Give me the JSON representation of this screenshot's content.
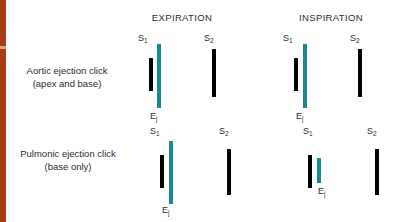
{
  "figure": {
    "background_color": "#ffffff",
    "accent_edge_color": "#a63c18",
    "black_color": "#000000",
    "teal_color": "#17888c"
  },
  "columns": [
    {
      "id": "expiration",
      "label": "EXPIRATION"
    },
    {
      "id": "inspiration",
      "label": "INSPIRATION"
    }
  ],
  "rows": [
    {
      "id": "aortic-ejection-click",
      "label_line1": "Aortic ejection click",
      "label_line2": "(apex and base)"
    },
    {
      "id": "pulmonic-ejection-click",
      "label_line1": "Pulmonic ejection click",
      "label_line2": "(base only)"
    }
  ],
  "sound_labels": {
    "s1": "S",
    "s1_sub": "1",
    "s2": "S",
    "s2_sub": "2",
    "ej": "E",
    "ej_sub": "j"
  },
  "chart_data": {
    "type": "bar",
    "xlabel": "",
    "ylabel": "",
    "grid": false,
    "legend": "none",
    "marks": [
      {
        "row": "aortic-ejection-click",
        "column": "expiration",
        "name": "S1",
        "color": "#000000",
        "x": 149,
        "y": 58,
        "width": 4,
        "height": 33,
        "label": "S1",
        "label_x": 138,
        "label_y": 33
      },
      {
        "row": "aortic-ejection-click",
        "column": "expiration",
        "name": "Ej",
        "color": "#17888c",
        "x": 157,
        "y": 44,
        "width": 4,
        "height": 64,
        "label": "Ej",
        "label_x": 150,
        "label_y": 111
      },
      {
        "row": "aortic-ejection-click",
        "column": "expiration",
        "name": "S2",
        "color": "#000000",
        "x": 212,
        "y": 49,
        "width": 4,
        "height": 48,
        "label": "S2",
        "label_x": 204,
        "label_y": 33
      },
      {
        "row": "aortic-ejection-click",
        "column": "inspiration",
        "name": "S1",
        "color": "#000000",
        "x": 294,
        "y": 58,
        "width": 4,
        "height": 33,
        "label": "S1",
        "label_x": 283,
        "label_y": 33
      },
      {
        "row": "aortic-ejection-click",
        "column": "inspiration",
        "name": "Ej",
        "color": "#17888c",
        "x": 303,
        "y": 44,
        "width": 4,
        "height": 64,
        "label": "Ej",
        "label_x": 296,
        "label_y": 111
      },
      {
        "row": "aortic-ejection-click",
        "column": "inspiration",
        "name": "S2",
        "color": "#000000",
        "x": 358,
        "y": 49,
        "width": 4,
        "height": 48,
        "label": "S2",
        "label_x": 350,
        "label_y": 33
      },
      {
        "row": "pulmonic-ejection-click",
        "column": "expiration",
        "name": "S1",
        "color": "#000000",
        "x": 160,
        "y": 155,
        "width": 4,
        "height": 33,
        "label": "S1",
        "label_x": 150,
        "label_y": 126
      },
      {
        "row": "pulmonic-ejection-click",
        "column": "expiration",
        "name": "Ej",
        "color": "#17888c",
        "x": 169,
        "y": 141,
        "width": 4,
        "height": 63,
        "label": "Ej",
        "label_x": 162,
        "label_y": 205
      },
      {
        "row": "pulmonic-ejection-click",
        "column": "expiration",
        "name": "S2",
        "color": "#000000",
        "x": 227,
        "y": 149,
        "width": 4,
        "height": 46,
        "label": "S2",
        "label_x": 219,
        "label_y": 126
      },
      {
        "row": "pulmonic-ejection-click",
        "column": "inspiration",
        "name": "S1",
        "color": "#000000",
        "x": 308,
        "y": 155,
        "width": 4,
        "height": 33,
        "label": "S1",
        "label_x": 303,
        "label_y": 126
      },
      {
        "row": "pulmonic-ejection-click",
        "column": "inspiration",
        "name": "Ej",
        "color": "#17888c",
        "x": 317,
        "y": 158,
        "width": 4,
        "height": 25,
        "label": "Ej",
        "label_x": 318,
        "label_y": 186
      },
      {
        "row": "pulmonic-ejection-click",
        "column": "inspiration",
        "name": "S2",
        "color": "#000000",
        "x": 375,
        "y": 149,
        "width": 4,
        "height": 46,
        "label": "S2",
        "label_x": 367,
        "label_y": 126
      }
    ]
  }
}
